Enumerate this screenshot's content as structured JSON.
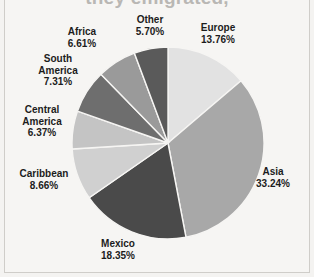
{
  "figure": {
    "title_partial": "they emigrated,",
    "background_color": "#f6f5f3",
    "border_color": "#cfcdc9"
  },
  "chart_data": {
    "type": "pie",
    "title": "they emigrated,",
    "xlabel": "",
    "ylabel": "",
    "legend_position": "none",
    "labels_outside": true,
    "start_angle_deg": 0,
    "direction": "clockwise",
    "categories": [
      "Europe",
      "Asia",
      "Mexico",
      "Caribbean",
      "Central America",
      "South America",
      "Africa",
      "Other"
    ],
    "values": [
      13.76,
      33.24,
      18.35,
      8.66,
      6.37,
      7.31,
      6.61,
      5.7
    ],
    "value_labels": [
      "13.76%",
      "33.24%",
      "18.35%",
      "8.66%",
      "6.37%",
      "7.31%",
      "6.61%",
      "5.70%"
    ],
    "colors": [
      "#e2e2e2",
      "#a8a8a8",
      "#4a4a4a",
      "#d0d0d0",
      "#c4c4c4",
      "#6e6e6e",
      "#9a9a9a",
      "#5a5a5a"
    ],
    "slice_separator_color": "#f6f5f3",
    "units": "percent",
    "total": 100.0
  },
  "labels": {
    "europe": {
      "name": "Europe",
      "pct": "13.76%"
    },
    "asia": {
      "name": "Asia",
      "pct": "33.24%"
    },
    "mexico": {
      "name": "Mexico",
      "pct": "18.35%"
    },
    "caribbean": {
      "name": "Caribbean",
      "pct": "8.66%"
    },
    "central_america": {
      "name": "Central",
      "name2": "America",
      "pct": "6.37%"
    },
    "south_america": {
      "name": "South",
      "name2": "America",
      "pct": "7.31%"
    },
    "africa": {
      "name": "Africa",
      "pct": "6.61%"
    },
    "other": {
      "name": "Other",
      "pct": "5.70%"
    }
  }
}
